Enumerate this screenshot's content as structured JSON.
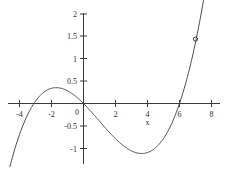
{
  "chart_data": {
    "type": "line",
    "title": "",
    "subtitle": "",
    "xlabel": "x",
    "ylabel": "",
    "xlim": [
      -4.6,
      8.6
    ],
    "ylim": [
      -1.25,
      2.15
    ],
    "grid": false,
    "legend": null,
    "axis_color": "#3a3a3a",
    "curve_color": "#4a4a4a",
    "point_color": "#3a3a3a",
    "background": "#ffffff",
    "x_ticks": [
      -4,
      -2,
      0,
      2,
      4,
      6,
      8
    ],
    "x_tick_labels": [
      "-4",
      "-2",
      "0",
      "2",
      "4",
      "6",
      "8"
    ],
    "y_ticks": [
      -1,
      -0.5,
      0,
      0.5,
      1,
      1.5,
      2
    ],
    "y_tick_labels": [
      "-1",
      "-0.5",
      "0",
      "0.5",
      "1",
      "1.5",
      "2"
    ],
    "roots": [
      -3.1,
      0,
      6.0
    ],
    "local_maximum": {
      "x": -1.6,
      "y": 0.35
    },
    "local_minimum": {
      "x": 3.5,
      "y": -1.05
    },
    "marked_points": [
      {
        "x": 7.0,
        "y": 1.43,
        "label": ""
      }
    ],
    "series": [
      {
        "name": "curve",
        "x": [
          -4.0,
          -3.8,
          -3.6,
          -3.4,
          -3.2,
          -3.0,
          -2.8,
          -2.6,
          -2.4,
          -2.2,
          -2.0,
          -1.8,
          -1.6,
          -1.4,
          -1.2,
          -1.0,
          -0.8,
          -0.6,
          -0.4,
          -0.2,
          0.0,
          0.2,
          0.4,
          0.6,
          0.8,
          1.0,
          1.2,
          1.4,
          1.6,
          1.8,
          2.0,
          2.2,
          2.4,
          2.6,
          2.8,
          3.0,
          3.2,
          3.4,
          3.6,
          3.8,
          4.0,
          4.2,
          4.4,
          4.6,
          4.8,
          5.0,
          5.2,
          5.4,
          5.6,
          5.8,
          6.0,
          6.2,
          6.4,
          6.6,
          6.8,
          7.0,
          7.2,
          7.35
        ],
        "y": [
          -0.8,
          -0.618,
          -0.45,
          -0.296,
          -0.158,
          -0.035,
          0.071,
          0.161,
          0.235,
          0.292,
          0.333,
          0.357,
          0.366,
          0.358,
          0.334,
          0.294,
          0.237,
          0.165,
          0.076,
          -0.028,
          -0.148,
          -0.283,
          -0.431,
          -0.59,
          -0.757,
          -0.925,
          -1.0,
          -1.03,
          -1.047,
          -1.052,
          -1.047,
          -1.035,
          -1.02,
          -1.01,
          -1.014,
          -1.036,
          -1.06,
          -1.063,
          -1.04,
          -0.985,
          -0.892,
          -0.758,
          -0.6,
          -0.43,
          -0.248,
          -0.055,
          0.12,
          0.3,
          0.49,
          0.72,
          0.0,
          0.0,
          0.0,
          0.0,
          0.0,
          1.43,
          1.8,
          2.1
        ]
      }
    ],
    "curve_path_note": "smooth cubic-like curve"
  }
}
